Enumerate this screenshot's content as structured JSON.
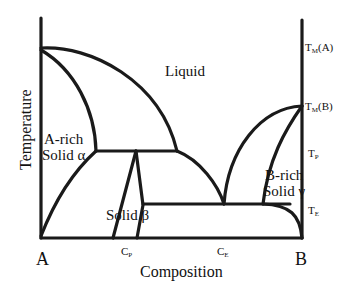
{
  "diagram": {
    "type": "binary phase diagram (eutectic + peritectic)",
    "axes": {
      "x_title": "Composition",
      "y_title": "Temperature",
      "x_left_end": "A",
      "x_right_end": "B"
    },
    "regions": {
      "liquid": "Liquid",
      "alpha_line1": "A-rich",
      "alpha_line2": "Solid α",
      "beta": "Solid β",
      "gamma_line1": "B-rich",
      "gamma_line2": "Solid γ"
    },
    "right_ticks": {
      "tma": {
        "main": "T",
        "sub": "M",
        "suffix": "(A)"
      },
      "tmb": {
        "main": "T",
        "sub": "M",
        "suffix": "(B)"
      },
      "tp": {
        "main": "T",
        "sub": "P",
        "suffix": ""
      },
      "te": {
        "main": "T",
        "sub": "E",
        "suffix": ""
      }
    },
    "bottom_ticks": {
      "cp": {
        "main": "C",
        "sub": "P"
      },
      "ce": {
        "main": "C",
        "sub": "E"
      }
    },
    "colors": {
      "line": "#1a1a1a",
      "background": "#ffffff"
    }
  }
}
